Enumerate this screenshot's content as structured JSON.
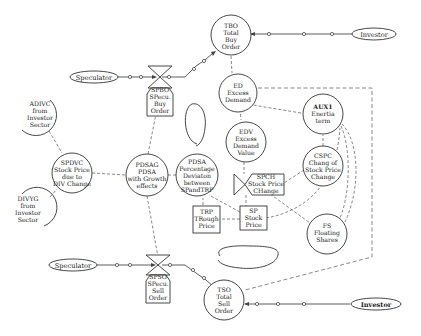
{
  "diagram": {
    "title": "",
    "nodes": {
      "tbo": {
        "lines": [
          "TBO",
          "Total",
          "Buy",
          "Order"
        ]
      },
      "investor_top": {
        "label": "Investor"
      },
      "speculator_top": {
        "label": "Speculator"
      },
      "spbo": {
        "lines": [
          "SPBO",
          "SPecu.",
          "Buy",
          "Order"
        ]
      },
      "ed": {
        "lines": [
          "ED",
          "Excess",
          "Demand"
        ]
      },
      "adivc": {
        "lines": [
          "ADIVC",
          "from",
          "Investor",
          "Sector"
        ]
      },
      "aux1": {
        "lines": [
          "AUX1",
          "Enertia",
          "term"
        ]
      },
      "edv": {
        "lines": [
          "EDV",
          "Excess",
          "Demand",
          "Value"
        ]
      },
      "spdvc": {
        "lines": [
          "SPDVC",
          "Stock Price",
          "due to",
          "DIV Change"
        ]
      },
      "pdsag": {
        "lines": [
          "PDSAG",
          "PDSA",
          "with Growth",
          "effects"
        ]
      },
      "pdsa": {
        "lines": [
          "PDSA",
          "Percentage",
          "Deviaton",
          "between",
          "SPandTRP"
        ]
      },
      "spch": {
        "lines": [
          "SPCH",
          "Stock Price",
          "CHange"
        ]
      },
      "cspc": {
        "lines": [
          "CSPC",
          "Chang of",
          "Stock Price",
          "Change"
        ]
      },
      "divyg": {
        "lines": [
          "DIVYG",
          "from",
          "Investor",
          "Sector"
        ]
      },
      "trp": {
        "lines": [
          "TRP",
          "TRough",
          "Price"
        ]
      },
      "sp": {
        "lines": [
          "SP",
          "Stock",
          "Price"
        ]
      },
      "fs": {
        "lines": [
          "FS",
          "Floating",
          "Shares"
        ]
      },
      "speculator_bottom": {
        "label": "Speculator"
      },
      "spso": {
        "lines": [
          "SPSO",
          "SPecu.",
          "Sell",
          "Order"
        ]
      },
      "tso": {
        "lines": [
          "TSO",
          "Total",
          "Sell",
          "Order"
        ]
      },
      "investor_bottom": {
        "label": "Investor"
      }
    }
  }
}
